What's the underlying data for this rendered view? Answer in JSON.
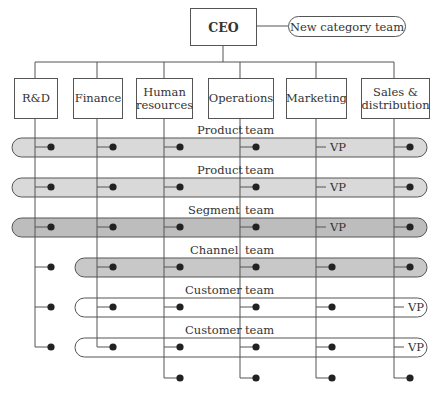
{
  "ceo": {
    "label": "CEO"
  },
  "new_team": {
    "label": "New category team"
  },
  "departments": [
    {
      "label": "R&D"
    },
    {
      "label": "Finance"
    },
    {
      "label": "Human resources"
    },
    {
      "label": "Operations"
    },
    {
      "label": "Marketing"
    },
    {
      "label": "Sales & distribution"
    }
  ],
  "teams": [
    {
      "left": "Product",
      "right": "team",
      "vp": "VP",
      "vp_column": "Marketing",
      "fill": "#d9d9d9"
    },
    {
      "left": "Product",
      "right": "team",
      "vp": "VP",
      "vp_column": "Marketing",
      "fill": "#d9d9d9"
    },
    {
      "left": "Segment",
      "right": "team",
      "vp": "VP",
      "vp_column": "Marketing",
      "fill": "#bdbdbd"
    },
    {
      "left": "Channel",
      "right": "team",
      "vp": "",
      "vp_column": "",
      "fill": "#c8c8c8"
    },
    {
      "left": "Customer",
      "right": "team",
      "vp": "VP",
      "vp_column": "Sales & distribution",
      "fill": "#ffffff"
    },
    {
      "left": "Customer",
      "right": "team",
      "vp": "VP",
      "vp_column": "Sales & distribution",
      "fill": "#ffffff"
    }
  ],
  "colors": {
    "line": "#555555",
    "dot": "#222222",
    "band_light": "#d9d9d9",
    "band_dark": "#bdbdbd",
    "band_mid": "#c8c8c8"
  }
}
